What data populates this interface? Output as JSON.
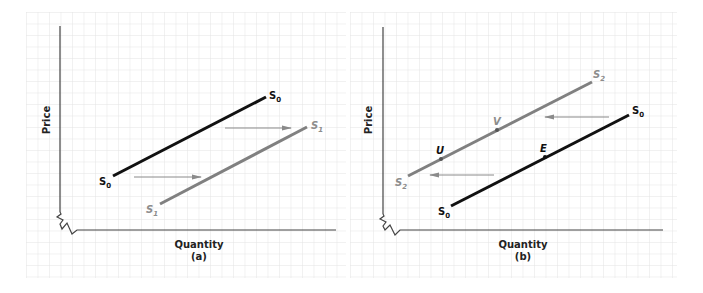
{
  "colors": {
    "grid": "#e6e6e6",
    "axis": "#444444",
    "original_curve": "#111111",
    "shifted_curve": "#808080",
    "arrow": "#8a8a8a",
    "label_dark": "#111111",
    "label_gray": "#8c8c8c"
  },
  "panels": [
    {
      "id": "a",
      "caption": "(a)",
      "y_axis_label": "Price",
      "x_axis_label": "Quantity",
      "curves": [
        {
          "name": "S0",
          "label_main": "S",
          "label_sub": "0",
          "color": "original_curve",
          "start_label": "S0",
          "end_label": "S0"
        },
        {
          "name": "S1",
          "label_main": "S",
          "label_sub": "1",
          "color": "shifted_curve",
          "start_label": "S1",
          "end_label": "S1"
        }
      ],
      "arrows": [
        {
          "direction": "right",
          "description": "supply shifts right from S0 to S1 (lower)"
        },
        {
          "direction": "right",
          "description": "supply shifts right from S0 to S1 (upper)"
        }
      ],
      "points": []
    },
    {
      "id": "b",
      "caption": "(b)",
      "y_axis_label": "Price",
      "x_axis_label": "Quantity",
      "curves": [
        {
          "name": "S2",
          "label_main": "S",
          "label_sub": "2",
          "color": "shifted_curve",
          "start_label": "S2",
          "end_label": "S2"
        },
        {
          "name": "S0",
          "label_main": "S",
          "label_sub": "0",
          "color": "original_curve",
          "start_label": "S0",
          "end_label": "S0"
        }
      ],
      "arrows": [
        {
          "direction": "left",
          "description": "supply shifts left from S0 to S2 (upper)"
        },
        {
          "direction": "left",
          "description": "supply shifts left from S0 to S2 (lower)"
        }
      ],
      "points": [
        {
          "label": "U",
          "on_curve": "S2"
        },
        {
          "label": "V",
          "on_curve": "S2"
        },
        {
          "label": "E",
          "on_curve": "S0"
        }
      ]
    }
  ]
}
